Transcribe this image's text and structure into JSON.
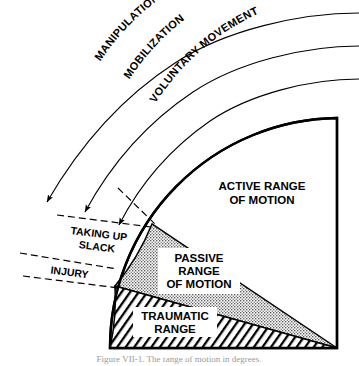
{
  "figure": {
    "type": "concept-diagram",
    "background_color": "#ffffff",
    "line_color": "#000000"
  },
  "arcs": [
    {
      "id": "manipulation",
      "label": "MANIPULATION"
    },
    {
      "id": "mobilization",
      "label": "MOBILIZATION"
    },
    {
      "id": "voluntary-movement",
      "label": "VOLUNTARY MOVEMENT"
    }
  ],
  "zones": [
    {
      "id": "active-range",
      "label_lines": [
        "ACTIVE RANGE",
        "OF MOTION"
      ],
      "fill": "none",
      "fill_color": "#ffffff"
    },
    {
      "id": "passive-range",
      "label_lines": [
        "PASSIVE",
        "RANGE",
        "OF MOTION"
      ],
      "fill": "stipple",
      "fill_color": "#b8b8b8"
    },
    {
      "id": "traumatic-range",
      "label_lines": [
        "TRAUMATIC",
        "RANGE"
      ],
      "fill": "hatch",
      "fill_color": "#000000"
    }
  ],
  "brackets": [
    {
      "id": "taking-up-slack",
      "label_lines": [
        "TAKING UP",
        "SLACK"
      ]
    },
    {
      "id": "injury",
      "label_lines": [
        "INJURY"
      ]
    }
  ],
  "caption": {
    "text": "Figure VII-1.  The range of motion in degrees."
  }
}
